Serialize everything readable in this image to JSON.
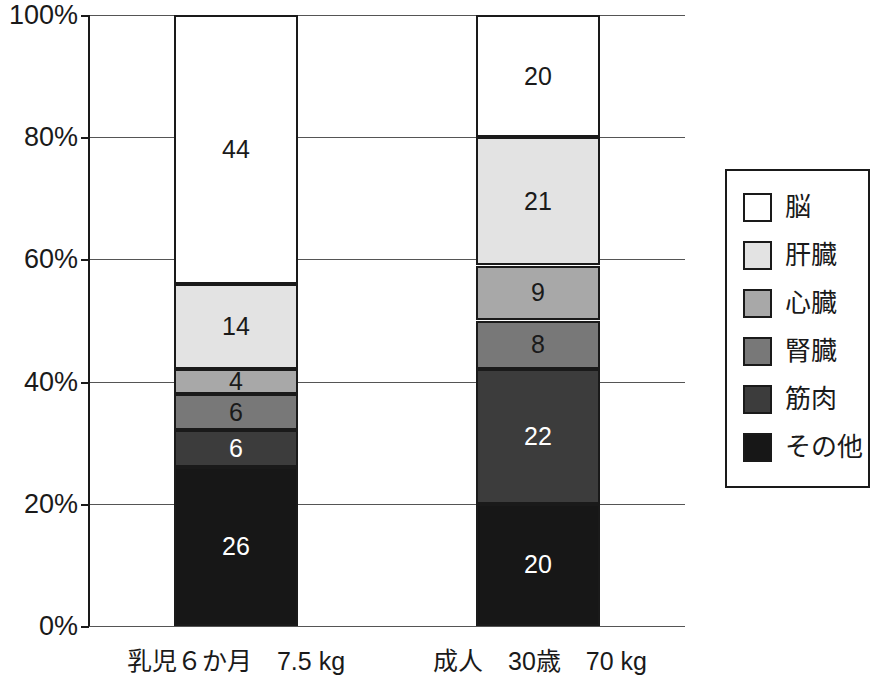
{
  "chart_data": {
    "type": "bar",
    "stacked": true,
    "normalized_percent": true,
    "title": "",
    "xlabel": "",
    "ylabel": "",
    "ylim": [
      0,
      100
    ],
    "ytick_labels": [
      "100%",
      "80%",
      "60%",
      "40%",
      "20%",
      "0%"
    ],
    "ytick_values": [
      100,
      80,
      60,
      40,
      20,
      0
    ],
    "grid": true,
    "legend_position": "right",
    "categories": [
      "乳児６か月　7.5 kg",
      "成人　30歳　70 kg"
    ],
    "series": [
      {
        "name": "脳",
        "values": [
          44,
          20
        ],
        "color": "#ffffff",
        "label_color": "#1a1a1a"
      },
      {
        "name": "肝臓",
        "values": [
          14,
          21
        ],
        "color": "#e3e3e3",
        "label_color": "#1a1a1a"
      },
      {
        "name": "心臓",
        "values": [
          4,
          9
        ],
        "color": "#a8a8a8",
        "label_color": "#1a1a1a"
      },
      {
        "name": "腎臓",
        "values": [
          6,
          8
        ],
        "color": "#787878",
        "label_color": "#1a1a1a"
      },
      {
        "name": "筋肉",
        "values": [
          6,
          22
        ],
        "color": "#3c3c3c",
        "label_color": "#ffffff"
      },
      {
        "name": "その他",
        "values": [
          26,
          20
        ],
        "color": "#171717",
        "label_color": "#ffffff"
      }
    ],
    "axis_color": "#1a1a1a",
    "grid_color": "#555555"
  },
  "legend": {
    "items": [
      {
        "label": "脳"
      },
      {
        "label": "肝臓"
      },
      {
        "label": "心臓"
      },
      {
        "label": "腎臓"
      },
      {
        "label": "筋肉"
      },
      {
        "label": "その他"
      }
    ]
  },
  "axis": {
    "ticks": [
      {
        "label": "100%"
      },
      {
        "label": "80%"
      },
      {
        "label": "60%"
      },
      {
        "label": "40%"
      },
      {
        "label": "20%"
      },
      {
        "label": "0%"
      }
    ]
  },
  "categories": [
    {
      "label": "乳児６か月　7.5 kg"
    },
    {
      "label": "成人　30歳　70 kg"
    }
  ]
}
